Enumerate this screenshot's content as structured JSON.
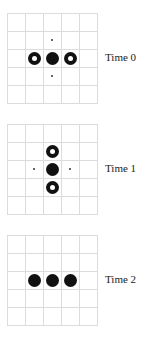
{
  "figure": {
    "grid_size": 5,
    "colors": {
      "grid": "#dcdcdc",
      "cell_filled": "#111111",
      "marker": "#333333"
    },
    "legend": {
      "filled": "solid black circle",
      "ring": "black circle with white center",
      "pip": "small dot"
    },
    "panels": [
      {
        "label": "Time 0",
        "cells": [
          {
            "row": 1,
            "col": 2,
            "type": "pip"
          },
          {
            "row": 2,
            "col": 1,
            "type": "ring"
          },
          {
            "row": 2,
            "col": 2,
            "type": "filled"
          },
          {
            "row": 2,
            "col": 3,
            "type": "ring"
          },
          {
            "row": 3,
            "col": 2,
            "type": "pip"
          }
        ]
      },
      {
        "label": "Time 1",
        "cells": [
          {
            "row": 1,
            "col": 2,
            "type": "ring"
          },
          {
            "row": 2,
            "col": 1,
            "type": "pip"
          },
          {
            "row": 2,
            "col": 2,
            "type": "filled"
          },
          {
            "row": 2,
            "col": 3,
            "type": "pip"
          },
          {
            "row": 3,
            "col": 2,
            "type": "ring"
          }
        ]
      },
      {
        "label": "Time 2",
        "cells": [
          {
            "row": 2,
            "col": 1,
            "type": "filled"
          },
          {
            "row": 2,
            "col": 2,
            "type": "filled"
          },
          {
            "row": 2,
            "col": 3,
            "type": "filled"
          }
        ]
      }
    ]
  }
}
